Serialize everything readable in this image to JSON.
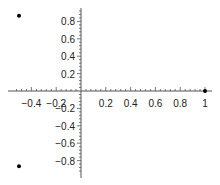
{
  "chart_data": {
    "type": "scatter",
    "title": "",
    "xlabel": "",
    "ylabel": "",
    "xlim": [
      -0.55,
      1.0
    ],
    "ylim": [
      -0.95,
      0.95
    ],
    "grid": false,
    "legend": null,
    "x_ticks": [
      -0.4,
      -0.2,
      0.2,
      0.4,
      0.6,
      0.8,
      1
    ],
    "x_tick_labels": [
      "−0.4",
      "−0.2",
      "0.2",
      "0.4",
      "0.6",
      "0.8",
      "1"
    ],
    "y_ticks": [
      0.8,
      0.6,
      0.4,
      0.2,
      -0.2,
      -0.4,
      -0.6,
      -0.8
    ],
    "y_tick_labels": [
      "0.8",
      "0.6",
      "0.4",
      "0.2",
      "−0.2",
      "−0.4",
      "−0.6",
      "−0.8"
    ],
    "series": [
      {
        "name": "points",
        "color": "#000000",
        "points": [
          {
            "x": 1.0,
            "y": 0.0
          },
          {
            "x": -0.5,
            "y": 0.866
          },
          {
            "x": -0.5,
            "y": -0.866
          }
        ]
      }
    ]
  }
}
